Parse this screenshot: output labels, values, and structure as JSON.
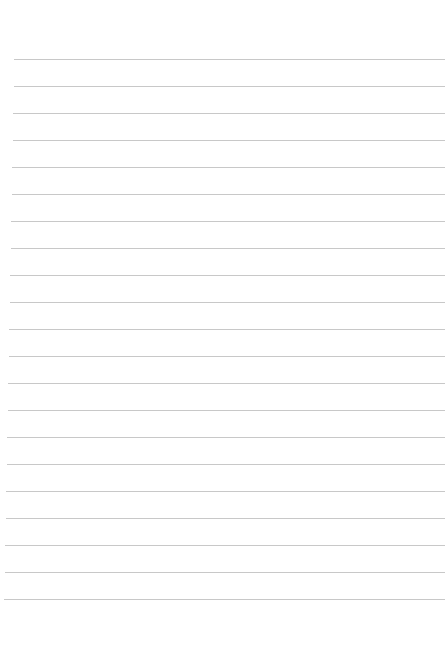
{
  "page": {
    "type": "ruled-paper",
    "background_color": "#ffffff",
    "line_color": "#c8c8c8",
    "line_count": 21,
    "first_line_y": 59,
    "line_spacing": 27,
    "left_margin_top": 14,
    "left_margin_bottom": 4,
    "right_edge": 445
  }
}
